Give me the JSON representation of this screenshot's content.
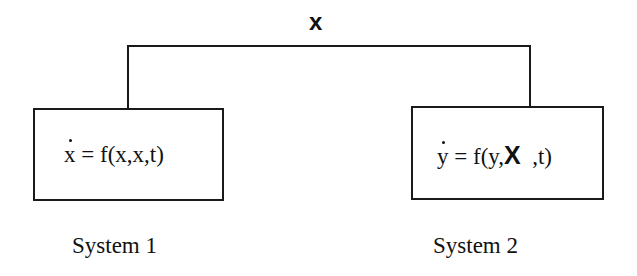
{
  "diagram": {
    "signal": {
      "label": "x",
      "from": "System 1",
      "to": "System 2"
    },
    "systems": [
      {
        "name": "System 1",
        "equation": {
          "lhs_var": "x",
          "lhs_dot": true,
          "rhs": " = f(x,x,t)"
        }
      },
      {
        "name": "System 2",
        "equation": {
          "lhs_var": "y",
          "lhs_dot": true,
          "rhs_prefix": " = f(y,",
          "rhs_bold": "X",
          "rhs_suffix": "  ,t)"
        }
      }
    ],
    "colors": {
      "line": "#1a1a1a",
      "background": "#ffffff"
    }
  }
}
